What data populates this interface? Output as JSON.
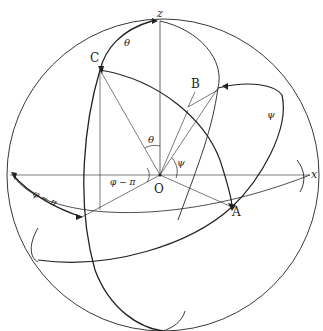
{
  "diagram": {
    "axes": {
      "z": "z",
      "x": "x"
    },
    "points": {
      "origin": "O",
      "A": "A",
      "B": "B",
      "C": "C"
    },
    "angles": {
      "theta_top": "θ",
      "theta_inner": "θ",
      "psi_inner": "ψ",
      "psi_right": "ψ",
      "phi_minus_pi_inner": "φ − π",
      "phi_minus_pi_left": "φ − π"
    },
    "colors": {
      "line": "#222222",
      "background": "#ffffff"
    }
  }
}
